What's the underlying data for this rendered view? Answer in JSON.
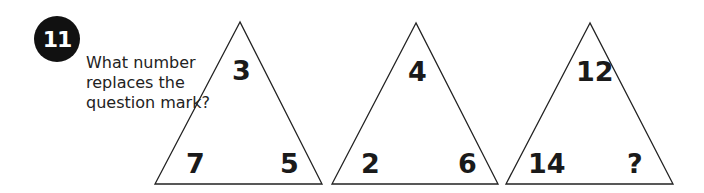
{
  "question_number": "11",
  "question_text": "What number replaces the question mark?",
  "triangles": [
    {
      "top": "3",
      "bottom_left": "7",
      "bottom_right": "5"
    },
    {
      "top": "4",
      "bottom_left": "2",
      "bottom_right": "6"
    },
    {
      "top": "12",
      "bottom_left": "14",
      "bottom_right": "?"
    }
  ]
}
